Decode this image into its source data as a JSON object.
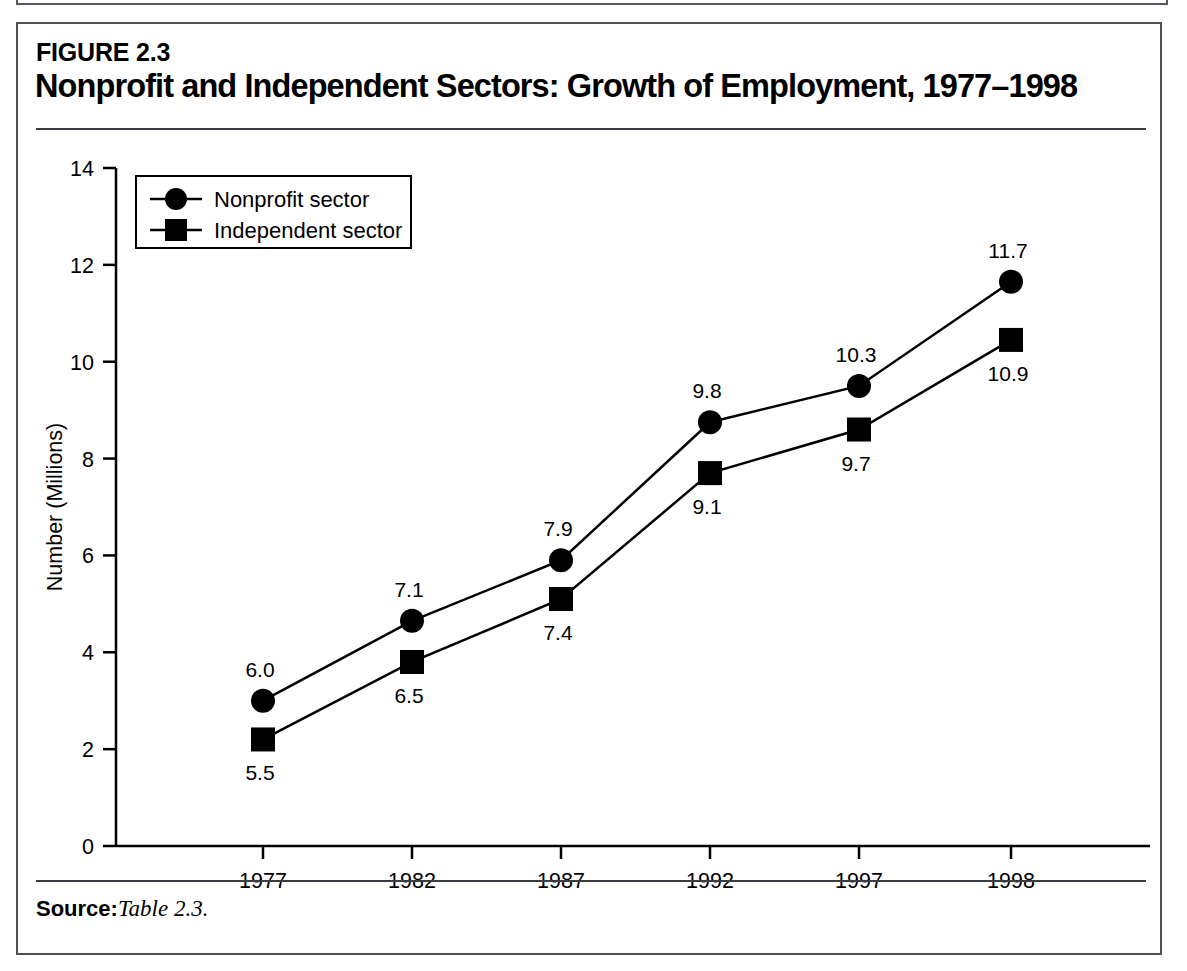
{
  "figure": {
    "number_label": "FIGURE 2.3",
    "title": "Nonprofit and Independent Sectors: Growth of Employment, 1977–1998",
    "source_label": "Source:",
    "source_value": "Table 2.3."
  },
  "chart_data": {
    "type": "line",
    "title": "Nonprofit and Independent Sectors: Growth of Employment, 1977–1998",
    "xlabel": "Year",
    "ylabel": "Number (Millions)",
    "categories": [
      "1977",
      "1982",
      "1987",
      "1992",
      "1997",
      "1998"
    ],
    "x_tick_labels": [
      "1977",
      "1982",
      "1987",
      "1992",
      "1997",
      "1998"
    ],
    "y_tick_labels": [
      "0",
      "2",
      "4",
      "6",
      "8",
      "10",
      "12",
      "14"
    ],
    "y_ticks": [
      0,
      2,
      4,
      6,
      8,
      10,
      12,
      14
    ],
    "ylim": [
      0,
      14
    ],
    "grid": false,
    "legend_position": "top-left",
    "series": [
      {
        "name": "Nonprofit sector",
        "marker": "circle",
        "color": "#000000",
        "plotted_values": [
          3.0,
          4.65,
          5.9,
          8.75,
          9.5,
          11.65
        ],
        "data_labels": [
          "6.0",
          "7.1",
          "7.9",
          "9.8",
          "10.3",
          "11.7"
        ],
        "label_position": "above"
      },
      {
        "name": "Independent sector",
        "marker": "square",
        "color": "#000000",
        "plotted_values": [
          2.2,
          3.8,
          5.1,
          7.7,
          8.6,
          10.45
        ],
        "data_labels": [
          "5.5",
          "6.5",
          "7.4",
          "9.1",
          "9.7",
          "10.9"
        ],
        "label_position": "below"
      }
    ]
  },
  "legend": {
    "entries": [
      {
        "label": "Nonprofit sector",
        "marker": "circle"
      },
      {
        "label": "Independent sector",
        "marker": "square"
      }
    ]
  }
}
